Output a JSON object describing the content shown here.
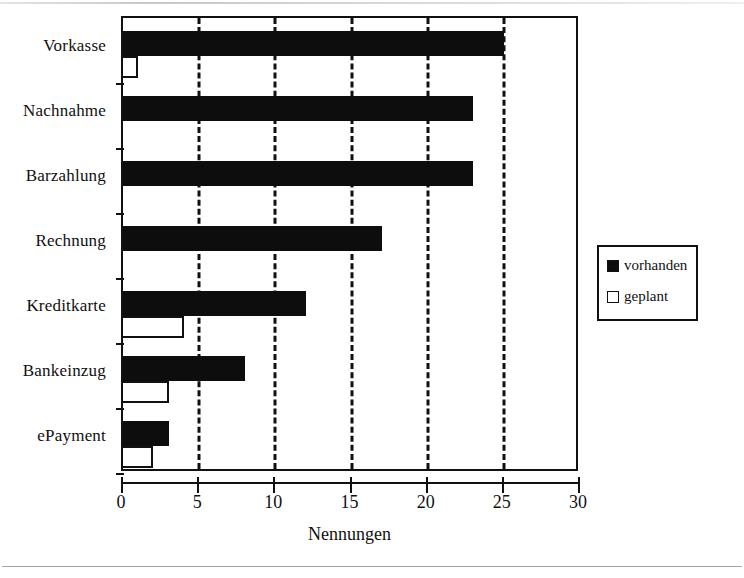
{
  "chart_data": {
    "type": "bar",
    "orientation": "horizontal",
    "title": "",
    "xlabel": "Nennungen",
    "ylabel": "",
    "xlim": [
      0,
      30
    ],
    "xticks": [
      0,
      5,
      10,
      15,
      20,
      25,
      30
    ],
    "xtick_labels": [
      "0",
      "5",
      "10",
      "15",
      "20",
      "25",
      "30"
    ],
    "grid": "vertical-dashed",
    "categories": [
      "Vorkasse",
      "Nachnahme",
      "Barzahlung",
      "Rechnung",
      "Kreditkarte",
      "Bankeinzug",
      "ePayment"
    ],
    "series": [
      {
        "name": "vorhanden",
        "color": "#0d0d0d",
        "fill": "solid",
        "values": [
          25,
          23,
          23,
          17,
          12,
          8,
          3
        ]
      },
      {
        "name": "geplant",
        "color": "#ffffff",
        "fill": "hollow",
        "values": [
          1,
          0,
          0,
          0,
          4,
          3,
          2
        ]
      }
    ],
    "legend": {
      "position": "right",
      "entries": [
        {
          "label": "vorhanden",
          "swatch": "filled-square"
        },
        {
          "label": "geplant",
          "swatch": "hollow-square"
        }
      ]
    }
  },
  "colors": {
    "ink": "#111111",
    "bar_vorhanden": "#0d0d0d",
    "bar_geplant": "#ffffff",
    "background": "#ffffff"
  }
}
